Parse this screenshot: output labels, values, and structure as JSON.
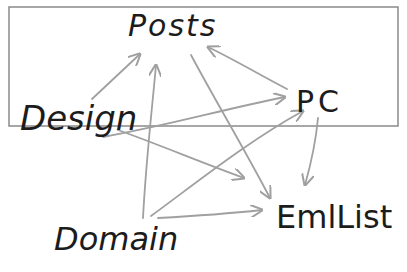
{
  "diagram": {
    "style": "hand-drawn",
    "border_color": "#8a8a8a",
    "edge_color": "#a0a0a0",
    "text_color": "#1c1c1c",
    "nodes": [
      {
        "id": "posts",
        "label": "Posts"
      },
      {
        "id": "pc",
        "label": "PC"
      },
      {
        "id": "design",
        "label": "Design"
      },
      {
        "id": "domain",
        "label": "Domain"
      },
      {
        "id": "emllist",
        "label": "EmlList"
      }
    ],
    "edges": [
      {
        "from": "design",
        "to": "posts"
      },
      {
        "from": "design",
        "to": "pc"
      },
      {
        "from": "design",
        "to": "emllist"
      },
      {
        "from": "domain",
        "to": "posts"
      },
      {
        "from": "domain",
        "to": "pc"
      },
      {
        "from": "domain",
        "to": "emllist"
      },
      {
        "from": "posts",
        "to": "emllist"
      },
      {
        "from": "pc",
        "to": "posts"
      },
      {
        "from": "pc",
        "to": "emllist"
      }
    ]
  }
}
